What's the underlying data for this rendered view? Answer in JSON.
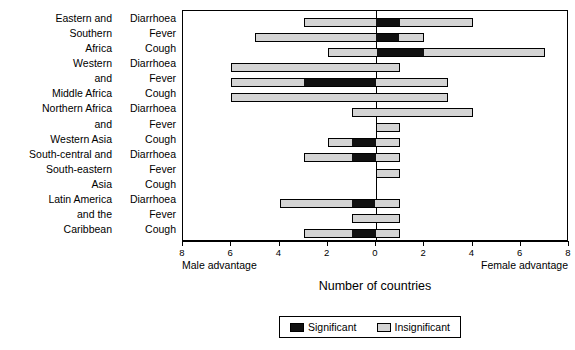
{
  "chart_data": {
    "type": "bar",
    "orientation": "horizontal",
    "title": "",
    "xlabel": "Number of countries",
    "ylabel": "",
    "xlim": [
      -8,
      8
    ],
    "xticks": [
      -8,
      -6,
      -4,
      -2,
      0,
      2,
      4,
      6,
      8
    ],
    "xticklabels": [
      "8",
      "6",
      "4",
      "2",
      "0",
      "2",
      "4",
      "6",
      "8"
    ],
    "grid": false,
    "axis_annotations": {
      "left": "Male advantage",
      "right": "Female advantage"
    },
    "legend": {
      "position": "bottom",
      "entries": [
        {
          "label": "Significant",
          "color": "#111111"
        },
        {
          "label": "Insignificant",
          "color": "#d4d4d4"
        }
      ]
    },
    "note": "Negative x = male advantage (left of zero); positive x = female advantage (right of zero). Each bar is stacked: insignificant (light grey) and significant (black) counts of countries.",
    "groups": [
      {
        "region": "Eastern and Southern Africa",
        "region_lines": [
          "Eastern and",
          "Southern",
          "Africa"
        ],
        "rows": [
          {
            "condition": "Diarrhoea",
            "start": -3,
            "end": 4,
            "significant_from": 0,
            "significant_to": 1,
            "male_total": 3,
            "female_total": 4
          },
          {
            "condition": "Fever",
            "start": -5,
            "end": 2,
            "significant_from": 0,
            "significant_to": 1,
            "male_total": 5,
            "female_total": 2
          },
          {
            "condition": "Cough",
            "start": -2,
            "end": 7,
            "significant_from": 0,
            "significant_to": 2,
            "male_total": 2,
            "female_total": 7
          }
        ]
      },
      {
        "region": "Western and Middle Africa",
        "region_lines": [
          "Western",
          "and",
          "Middle Africa"
        ],
        "rows": [
          {
            "condition": "Diarrhoea",
            "start": -6,
            "end": 1,
            "significant_from": 0,
            "significant_to": 0,
            "male_total": 6,
            "female_total": 1
          },
          {
            "condition": "Fever",
            "start": -6,
            "end": 3,
            "significant_from": -3,
            "significant_to": 0,
            "male_total": 6,
            "female_total": 3
          },
          {
            "condition": "Cough",
            "start": -6,
            "end": 3,
            "significant_from": 0,
            "significant_to": 0,
            "male_total": 6,
            "female_total": 3
          }
        ]
      },
      {
        "region": "Northern Africa and Western Asia",
        "region_lines": [
          "Northern Africa",
          "and",
          "Western Asia"
        ],
        "rows": [
          {
            "condition": "Diarrhoea",
            "start": -1,
            "end": 4,
            "significant_from": 0,
            "significant_to": 0,
            "male_total": 1,
            "female_total": 4
          },
          {
            "condition": "Fever",
            "start": 0,
            "end": 1,
            "significant_from": 0,
            "significant_to": 0,
            "male_total": 0,
            "female_total": 1
          },
          {
            "condition": "Cough",
            "start": -2,
            "end": 1,
            "significant_from": -1,
            "significant_to": 0,
            "male_total": 2,
            "female_total": 1
          }
        ]
      },
      {
        "region": "South-central and South-eastern Asia",
        "region_lines": [
          "South-central and",
          "South-eastern",
          "Asia"
        ],
        "rows": [
          {
            "condition": "Diarrhoea",
            "start": -3,
            "end": 1,
            "significant_from": -1,
            "significant_to": 0,
            "male_total": 3,
            "female_total": 1
          },
          {
            "condition": "Fever",
            "start": 0,
            "end": 1,
            "significant_from": 0,
            "significant_to": 0,
            "male_total": 0,
            "female_total": 1
          },
          {
            "condition": "Cough",
            "start": 0,
            "end": 0,
            "significant_from": 0,
            "significant_to": 0,
            "male_total": 0,
            "female_total": 0
          }
        ]
      },
      {
        "region": "Latin America and the Caribbean",
        "region_lines": [
          "Latin America",
          "and the",
          "Caribbean"
        ],
        "rows": [
          {
            "condition": "Diarrhoea",
            "start": -4,
            "end": 1,
            "significant_from": -1,
            "significant_to": 0,
            "male_total": 4,
            "female_total": 1
          },
          {
            "condition": "Fever",
            "start": -1,
            "end": 1,
            "significant_from": 0,
            "significant_to": 0,
            "male_total": 1,
            "female_total": 1
          },
          {
            "condition": "Cough",
            "start": -3,
            "end": 1,
            "significant_from": -1,
            "significant_to": 0,
            "male_total": 3,
            "female_total": 1
          }
        ]
      }
    ]
  },
  "axis": {
    "x_title": "Number of countries",
    "male_advantage": "Male advantage",
    "female_advantage": "Female advantage",
    "tick_labels": [
      "8",
      "6",
      "4",
      "2",
      "0",
      "2",
      "4",
      "6",
      "8"
    ]
  },
  "legend": {
    "significant": "Significant",
    "insignificant": "Insignificant"
  },
  "region_labels": [
    "Eastern and",
    "Southern",
    "Africa",
    "Western",
    "and",
    "Middle Africa",
    "Northern Africa",
    "and",
    "Western Asia",
    "South-central and",
    "South-eastern",
    "Asia",
    "Latin America",
    "and the",
    "Caribbean"
  ],
  "condition_labels": [
    "Diarrhoea",
    "Fever",
    "Cough",
    "Diarrhoea",
    "Fever",
    "Cough",
    "Diarrhoea",
    "Fever",
    "Cough",
    "Diarrhoea",
    "Fever",
    "Cough",
    "Diarrhoea",
    "Fever",
    "Cough"
  ]
}
